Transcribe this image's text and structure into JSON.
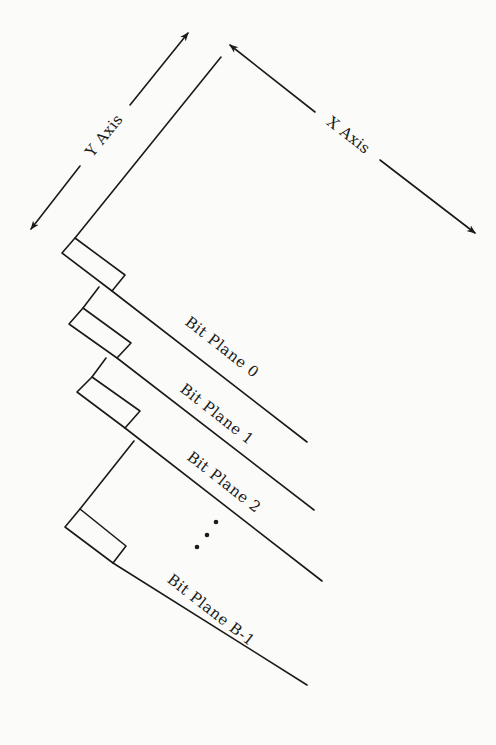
{
  "diagram": {
    "type": "bit-plane decomposition",
    "axes": {
      "y_label": "Y Axis",
      "x_label": "X Axis"
    },
    "planes": [
      {
        "label": "Bit Plane 0"
      },
      {
        "label": "Bit Plane 1"
      },
      {
        "label": "Bit Plane 2"
      },
      {
        "label": "Bit Plane B-1"
      }
    ],
    "ellipsis": "⋮",
    "colors": {
      "ink": "#1a1a1a",
      "paper": "#fbfbf9"
    }
  }
}
